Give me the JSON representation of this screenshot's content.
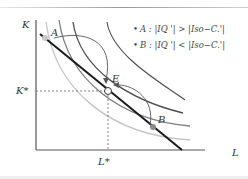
{
  "diagram": {
    "type": "isoquant-isocost",
    "axes": {
      "y_label": "K",
      "x_label": "L",
      "y_star_label": "K*",
      "x_star_label": "L*"
    },
    "points": {
      "A": "A",
      "B": "B",
      "E": "E"
    },
    "legend": [
      {
        "bullet": "•",
        "text": "A : |IQ '| > |Iso−C.'|"
      },
      {
        "bullet": "•",
        "text": "B : |IQ '| < |Iso−C.'|"
      }
    ],
    "colors": {
      "isocost_line": "#1a1a1a",
      "isoquant_dark": "#4a4a4a",
      "isoquant_mid": "#7a7a7a",
      "isoquant_light": "#bdbdbd",
      "point_A": "#c8c8c8",
      "point_B": "#8a8a8a"
    }
  }
}
